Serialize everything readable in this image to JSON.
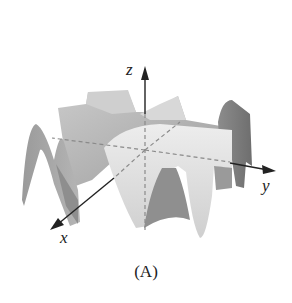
{
  "figure": {
    "caption": "(A)",
    "axes": {
      "x_label": "x",
      "y_label": "y",
      "z_label": "z"
    },
    "colors": {
      "background": "#ffffff",
      "surface_light": "#e4e4e4",
      "surface_mid": "#b8b8b8",
      "surface_dark": "#7a7a7a",
      "axis": "#222222",
      "hidden_axis_dash": "#8a8a8a"
    }
  }
}
